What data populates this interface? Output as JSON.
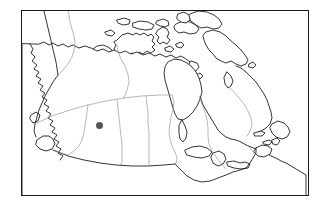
{
  "figure": {
    "title": "",
    "caption": "",
    "type": "locator-map"
  },
  "frame": {
    "x": 21,
    "y": 10,
    "width": 288,
    "height": 186,
    "border_color": "#1a1a1a",
    "background_color": "#ffffff"
  },
  "styles": {
    "coastline_color": "#111111",
    "province_border_color": "#9a9a9a",
    "international_border_color": "#111111",
    "land_fill": "#ffffff",
    "water_fill": "#ffffff",
    "marker_color": "#555555"
  },
  "markers": [
    {
      "name": "location-marker",
      "shape": "circle",
      "x": 99,
      "y": 125,
      "diameter": 7,
      "color": "#555555",
      "label": ""
    }
  ],
  "regions": [
    {
      "name": "arctic-archipelago"
    },
    {
      "name": "baffin-island"
    },
    {
      "name": "hudson-bay"
    },
    {
      "name": "mainland-canada"
    },
    {
      "name": "newfoundland"
    },
    {
      "name": "vancouver-island"
    },
    {
      "name": "great-lakes"
    }
  ],
  "borders": {
    "international": [
      "alaska-yukon-meridian",
      "canada-usa-49th-parallel"
    ],
    "provincial": [
      "yukon-northwest-territories",
      "northwest-territories-nunavut",
      "sixtieth-parallel",
      "british-columbia-alberta",
      "alberta-saskatchewan",
      "saskatchewan-manitoba",
      "manitoba-ontario",
      "ontario-quebec",
      "quebec-labrador"
    ]
  }
}
